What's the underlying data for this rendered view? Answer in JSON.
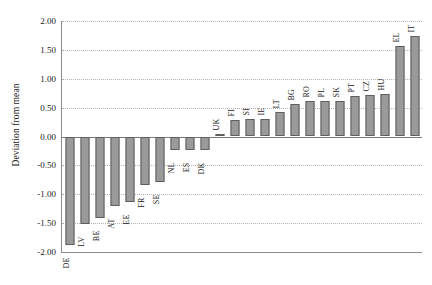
{
  "chart_data": {
    "type": "bar",
    "title": "",
    "subtitle": "",
    "xlabel": "",
    "ylabel": "Deviation from mean",
    "ylim": [
      -2.0,
      2.0
    ],
    "yticks": [
      2.0,
      1.5,
      1.0,
      0.5,
      0.0,
      -0.5,
      -1.0,
      -1.5,
      -2.0
    ],
    "ytick_labels": [
      "2.00",
      "1.50",
      "1.00",
      "0.50",
      "0.00",
      "-0.50",
      "-1.00",
      "-1.50",
      "-2.00"
    ],
    "grid": true,
    "grid_style": "dotted-horizontal",
    "legend": null,
    "legend_position": "none",
    "bar_color": "#9a9a9a",
    "bar_edge_color": "#5f5f5f",
    "categories": [
      "DE",
      "LV",
      "BE",
      "AT",
      "EE",
      "FR",
      "SE",
      "NL",
      "ES",
      "DK",
      "UK",
      "FI",
      "SI",
      "IE",
      "LT",
      "BG",
      "RO",
      "PL",
      "SK",
      "PT",
      "CZ",
      "HU",
      "EL",
      "IT"
    ],
    "values": [
      -1.88,
      -1.51,
      -1.41,
      -1.2,
      -1.13,
      -0.84,
      -0.79,
      -0.23,
      -0.23,
      -0.23,
      0.04,
      0.28,
      0.3,
      0.31,
      0.42,
      0.56,
      0.62,
      0.62,
      0.62,
      0.7,
      0.72,
      0.74,
      1.57,
      1.74
    ],
    "annotations": []
  }
}
